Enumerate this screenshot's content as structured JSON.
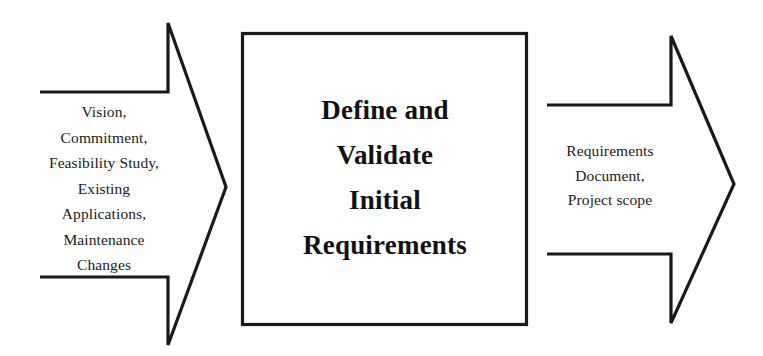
{
  "diagram": {
    "type": "process-flow",
    "background_color": "#ffffff",
    "stroke_color": "#1a1a1a",
    "text_color": "#1a1a1a",
    "input_arrow": {
      "name": "input-arrow",
      "direction": "right",
      "lines": [
        "Vision,",
        "Commitment,",
        "Feasibility Study,",
        "Existing",
        "Applications,",
        "Maintenance",
        "Changes"
      ]
    },
    "process_box": {
      "name": "process-box",
      "lines": [
        "Define and",
        "Validate",
        "Initial",
        "Requirements"
      ]
    },
    "output_arrow": {
      "name": "output-arrow",
      "direction": "right",
      "lines": [
        "Requirements",
        "Document,",
        "Project scope"
      ]
    }
  }
}
